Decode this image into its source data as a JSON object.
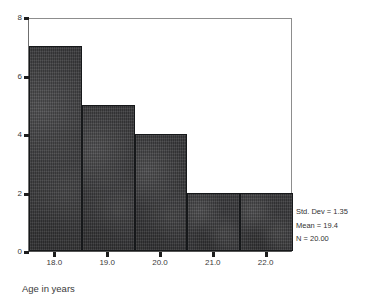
{
  "chart_data": {
    "type": "bar",
    "subtype": "histogram",
    "title": "",
    "xlabel": "Age in years",
    "ylabel": "",
    "categories": [
      "18.0",
      "19.0",
      "20.0",
      "21.0",
      "22.0"
    ],
    "values": [
      7,
      5,
      4,
      2,
      2
    ],
    "bin_centers": [
      18.0,
      19.0,
      20.0,
      21.0,
      22.0
    ],
    "bin_width": 1.0,
    "xlim": [
      17.5,
      22.5
    ],
    "ylim": [
      0,
      8
    ],
    "x_ticks": [
      "18.0",
      "19.0",
      "20.0",
      "21.0",
      "22.0"
    ],
    "y_ticks": [
      "0",
      "2",
      "4",
      "6",
      "8"
    ],
    "grid": false,
    "legend": false,
    "bar_color": "#3b3b3d",
    "bar_edge_color": "#16181a",
    "frame_color": "#8d8d8d",
    "background": "#ffffff",
    "annotations": [
      "Std. Dev = 1.35",
      "Mean = 19.4",
      "N = 20.00"
    ]
  },
  "axes": {
    "x": {
      "title": "Age in years",
      "ticks": [
        {
          "label": "18.0",
          "value": 18.0
        },
        {
          "label": "19.0",
          "value": 19.0
        },
        {
          "label": "20.0",
          "value": 20.0
        },
        {
          "label": "21.0",
          "value": 21.0
        },
        {
          "label": "22.0",
          "value": 22.0
        }
      ]
    },
    "y": {
      "title": "",
      "ticks": [
        {
          "label": "0",
          "value": 0
        },
        {
          "label": "2",
          "value": 2
        },
        {
          "label": "4",
          "value": 4
        },
        {
          "label": "6",
          "value": 6
        },
        {
          "label": "8",
          "value": 8
        }
      ]
    }
  },
  "stats": {
    "std_dev": "Std. Dev = 1.35",
    "mean": "Mean = 19.4",
    "n": "N = 20.00"
  }
}
